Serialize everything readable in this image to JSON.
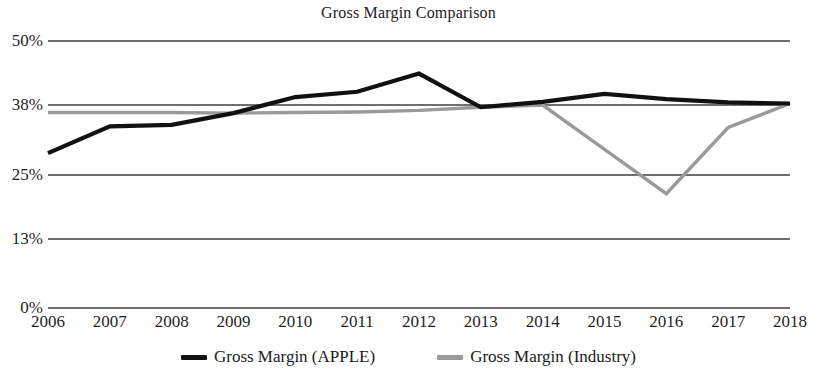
{
  "chart_data": {
    "type": "line",
    "title": "Gross Margin Comparison",
    "xlabel": "",
    "ylabel": "",
    "x": [
      2006,
      2007,
      2008,
      2009,
      2010,
      2011,
      2012,
      2013,
      2014,
      2015,
      2016,
      2017,
      2018
    ],
    "categories": [
      "2006",
      "2007",
      "2008",
      "2009",
      "2010",
      "2011",
      "2012",
      "2013",
      "2014",
      "2015",
      "2016",
      "2017",
      "2018"
    ],
    "ylim": [
      0,
      50
    ],
    "ytick_values": [
      50,
      38,
      25,
      13,
      0
    ],
    "ytick_labels": [
      "50%",
      "38%",
      "25%",
      "13%",
      "0%"
    ],
    "grid": true,
    "legend_position": "bottom",
    "series": [
      {
        "name": "Gross Margin (APPLE)",
        "color": "#111111",
        "values": [
          29.0,
          34.0,
          34.3,
          36.5,
          39.5,
          40.5,
          43.9,
          37.6,
          38.6,
          40.1,
          39.1,
          38.5,
          38.3
        ]
      },
      {
        "name": "Gross Margin (Industry)",
        "color": "#9a9a9a",
        "values": [
          36.6,
          36.6,
          36.6,
          36.5,
          36.6,
          36.7,
          37.0,
          37.6,
          38.0,
          29.7,
          21.4,
          33.8,
          38.3
        ]
      }
    ]
  },
  "legend": {
    "entries": [
      {
        "label": "Gross Margin (APPLE)",
        "color": "#111111"
      },
      {
        "label": "Gross Margin (Industry)",
        "color": "#9a9a9a"
      }
    ]
  },
  "axes": {
    "y_ticks": [
      "50%",
      "38%",
      "25%",
      "13%",
      "0%"
    ],
    "x_ticks": [
      "2006",
      "2007",
      "2008",
      "2009",
      "2010",
      "2011",
      "2012",
      "2013",
      "2014",
      "2015",
      "2016",
      "2017",
      "2018"
    ]
  }
}
